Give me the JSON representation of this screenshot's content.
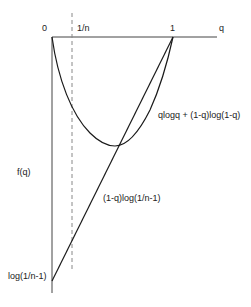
{
  "diagram": {
    "axis_labels": {
      "origin": "0",
      "one_over_n": "1/n",
      "one": "1",
      "x_axis": "q",
      "y_axis": "f(q)",
      "y_intercept": "log(1/n-1)"
    },
    "curve_labels": {
      "entropy_curve": "qlogq + (1-q)log(1-q)",
      "linear_line": "(1-q)log(1/n-1)"
    },
    "colors": {
      "curve": "#1a1a1a",
      "axis": "#444444",
      "dashed": "#888888"
    }
  }
}
